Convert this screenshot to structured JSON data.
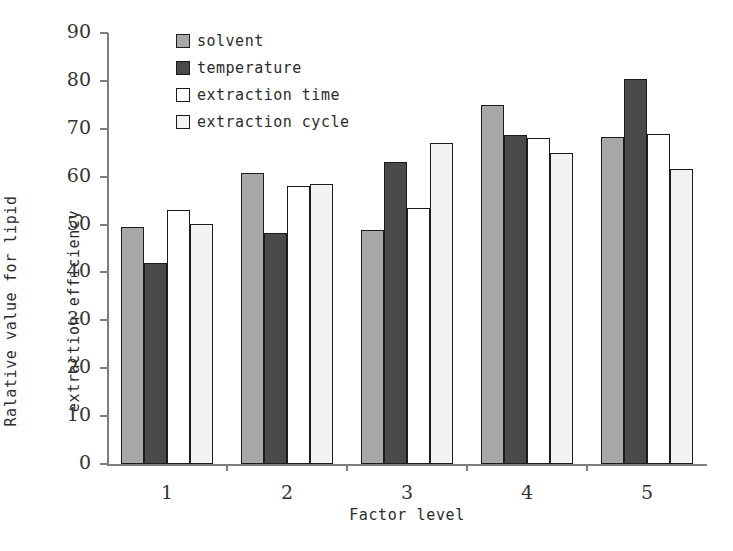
{
  "chart_data": {
    "type": "bar",
    "title": "",
    "xlabel": "Factor level",
    "ylabel": "Ralative value for lipid\nextraction efficiency",
    "ylabel_lines": [
      "Ralative value for lipid",
      "extraction efficiency"
    ],
    "categories": [
      "1",
      "2",
      "3",
      "4",
      "5"
    ],
    "ylim": [
      0,
      90
    ],
    "yticks": [
      0,
      10,
      20,
      30,
      40,
      50,
      60,
      70,
      80,
      90
    ],
    "ytick_labels": [
      "0",
      "10",
      "20",
      "30",
      "40",
      "50",
      "60",
      "70",
      "80",
      "90"
    ],
    "grid": false,
    "legend_position": "upper-left-inside",
    "series": [
      {
        "name": "solvent",
        "color": "#a8a8a8",
        "values": [
          49.4,
          60.8,
          48.9,
          75.0,
          68.3
        ]
      },
      {
        "name": "temperature",
        "color": "#4a4a4a",
        "values": [
          42.0,
          48.2,
          63.0,
          68.7,
          80.5
        ]
      },
      {
        "name": "extraction time",
        "color": "#ffffff",
        "values": [
          53.0,
          58.0,
          53.5,
          68.0,
          69.0
        ]
      },
      {
        "name": "extraction cycle",
        "color": "#f2f2f2",
        "values": [
          50.2,
          58.5,
          67.0,
          65.0,
          61.7
        ]
      }
    ]
  },
  "legend": {
    "items": [
      {
        "label": "solvent",
        "color": "#a8a8a8"
      },
      {
        "label": "temperature",
        "color": "#4a4a4a"
      },
      {
        "label": "extraction time",
        "color": "#ffffff"
      },
      {
        "label": "extraction cycle",
        "color": "#f2f2f2"
      }
    ]
  },
  "axes": {
    "x_title": "Factor level",
    "y_title_line1": "Ralative value for lipid",
    "y_title_line2": "extraction efficiency"
  },
  "caption": {
    "text": ""
  },
  "colors": {
    "bar_outline": "#1b1b1b",
    "axis": "#7d7d7d",
    "text": "#2b2b2b"
  }
}
